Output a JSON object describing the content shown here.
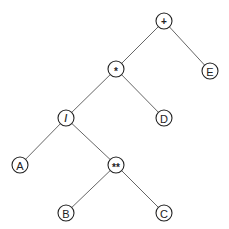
{
  "diagram": {
    "type": "expression-tree",
    "nodes": [
      {
        "id": "plus",
        "label": "+",
        "kind": "operator",
        "x": 164,
        "y": 21
      },
      {
        "id": "mul",
        "label": "*",
        "kind": "operator",
        "x": 116,
        "y": 69
      },
      {
        "id": "E",
        "label": "E",
        "kind": "operand",
        "x": 210,
        "y": 71
      },
      {
        "id": "div",
        "label": "/",
        "kind": "operator",
        "x": 66,
        "y": 118
      },
      {
        "id": "D",
        "label": "D",
        "kind": "operand",
        "x": 164,
        "y": 118
      },
      {
        "id": "A",
        "label": "A",
        "kind": "operand",
        "x": 20,
        "y": 165
      },
      {
        "id": "pow",
        "label": "**",
        "kind": "operator",
        "x": 116,
        "y": 165
      },
      {
        "id": "B",
        "label": "B",
        "kind": "operand",
        "x": 66,
        "y": 213
      },
      {
        "id": "C",
        "label": "C",
        "kind": "operand",
        "x": 164,
        "y": 213
      }
    ],
    "edges": [
      {
        "from": "plus",
        "to": "mul"
      },
      {
        "from": "plus",
        "to": "E"
      },
      {
        "from": "mul",
        "to": "div"
      },
      {
        "from": "mul",
        "to": "D"
      },
      {
        "from": "div",
        "to": "A"
      },
      {
        "from": "div",
        "to": "pow"
      },
      {
        "from": "pow",
        "to": "B"
      },
      {
        "from": "pow",
        "to": "C"
      }
    ],
    "node_radius": 8
  }
}
